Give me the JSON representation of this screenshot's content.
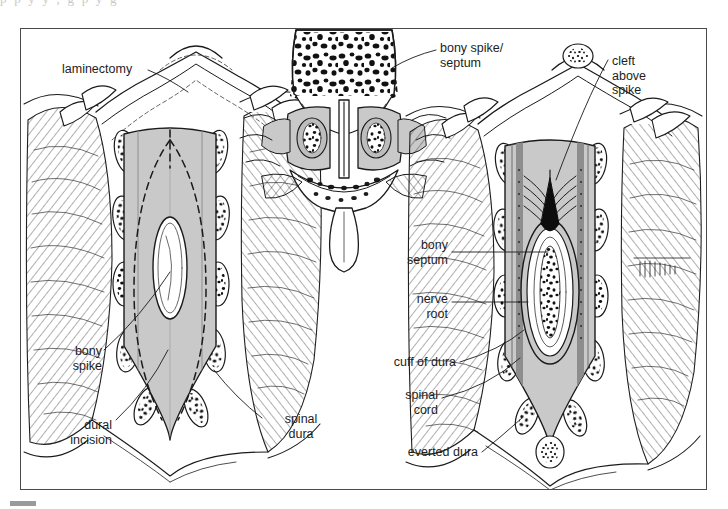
{
  "page": {
    "top_cut_text": "p      p                 y        y        ,        g        p           y                g",
    "figure_border_color": "#4a4a4a",
    "background_color": "#ffffff",
    "tint_color": "#c9c9c9",
    "ink_color": "#1a1a1a",
    "corner_marker_color": "#9a9a9a"
  },
  "illustration": {
    "title": "Surgical repair of diastematomyelia",
    "panels": [
      {
        "name": "left-panel",
        "caption": "Laminectomy exposure with planned dural incision"
      },
      {
        "name": "center-panel",
        "caption": "Axial cross-section through vertebra showing bony spike/septum"
      },
      {
        "name": "right-panel",
        "caption": "Dura opened and everted exposing bony septum and split cord"
      }
    ]
  },
  "labels": {
    "laminectomy": "laminectomy",
    "bony_spike_septum": "bony spike/\nseptum",
    "cleft_above_spike": "cleft\nabove\nspike",
    "bony_spike": "bony\nspike",
    "dural_incision": "dural\nincision",
    "spinal_dura": "spinal\ndura",
    "bony_septum": "bony\nseptum",
    "nerve_root": "nerve\nroot",
    "cuff_of_dura": "cuff of dura",
    "spinal_cord": "spinal\ncord",
    "everted_dura": "everted dura"
  }
}
